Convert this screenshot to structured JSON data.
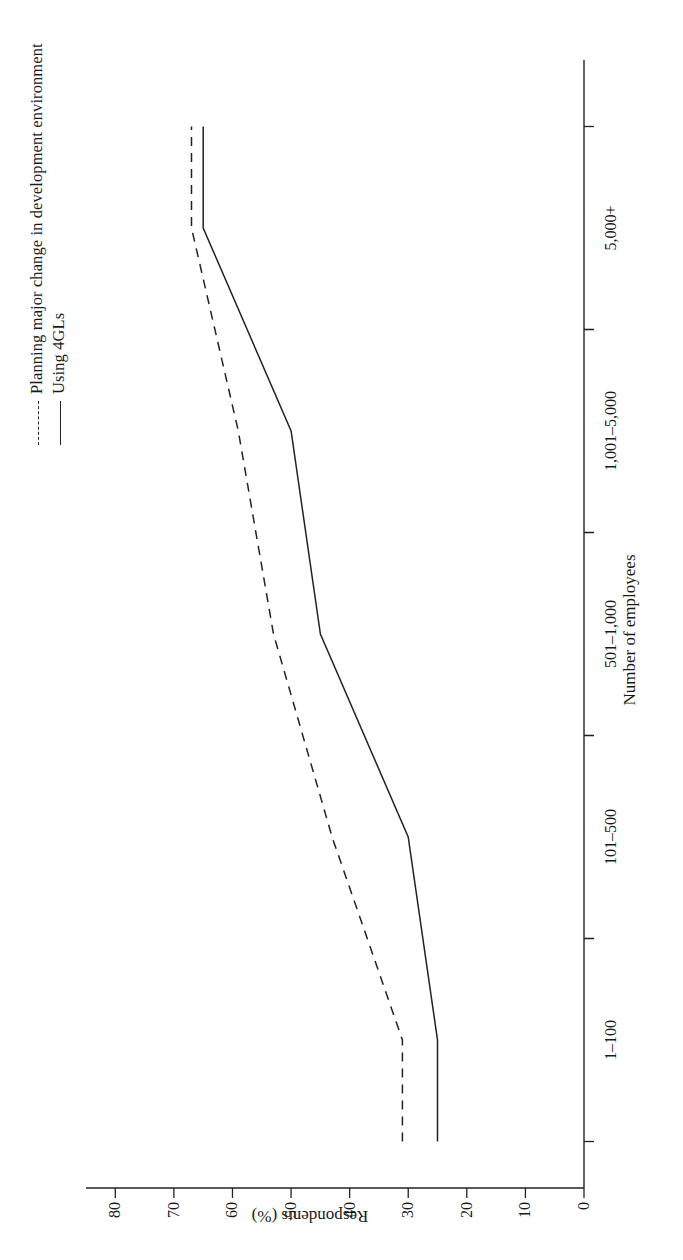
{
  "figure": {
    "orientation": "rotated-90-ccw"
  },
  "legend": {
    "position": "top-left",
    "items": [
      {
        "label": "Planning major change in development environment",
        "style": "dashed",
        "swatch": "dashed-line-swatch"
      },
      {
        "label": "Using 4GLs",
        "style": "solid",
        "swatch": "solid-line-swatch"
      }
    ]
  },
  "chart_data": {
    "type": "line",
    "title": "",
    "xlabel": "Number of employees",
    "ylabel": "Respondents (%)",
    "categories": [
      "1–100",
      "101–500",
      "501–1,000",
      "1,001–5,000",
      "5,000+"
    ],
    "x_tick_labels": [
      "1–100",
      "101–500",
      "501–1,000",
      "1,001–5,000",
      "5,000+"
    ],
    "y_tick_labels": [
      "0",
      "10",
      "20",
      "30",
      "40",
      "50",
      "60",
      "70",
      "80"
    ],
    "y_ticks": [
      0,
      10,
      20,
      30,
      40,
      50,
      60,
      70,
      80
    ],
    "ylim": [
      0,
      85
    ],
    "grid": false,
    "series": [
      {
        "name": "Planning major change in development environment",
        "style": "dashed",
        "color": "#222222",
        "values": [
          31,
          43,
          53,
          59,
          67
        ]
      },
      {
        "name": "Using 4GLs",
        "style": "solid",
        "color": "#222222",
        "values": [
          25,
          30,
          45,
          50,
          65
        ]
      }
    ]
  },
  "axis": {
    "line_color": "#222222"
  }
}
